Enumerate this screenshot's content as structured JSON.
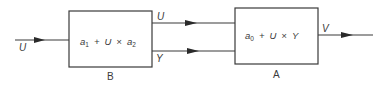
{
  "diagram": {
    "blocks": [
      {
        "id": "B",
        "name": "B",
        "expression": {
          "a": "a",
          "a_sub": "1",
          "op1": "+",
          "u": "U",
          "op2": "×",
          "b": "a",
          "b_sub": "2"
        }
      },
      {
        "id": "A",
        "name": "A",
        "expression": {
          "a": "a",
          "a_sub": "0",
          "op1": "+",
          "u": "U",
          "op2": "×",
          "y": "Y"
        }
      }
    ],
    "signals": {
      "input": "U",
      "b_out_top": "U",
      "b_out_bottom": "Y",
      "output": "V"
    },
    "colors": {
      "line": "#3a3a3a",
      "background": "#ffffff"
    }
  }
}
